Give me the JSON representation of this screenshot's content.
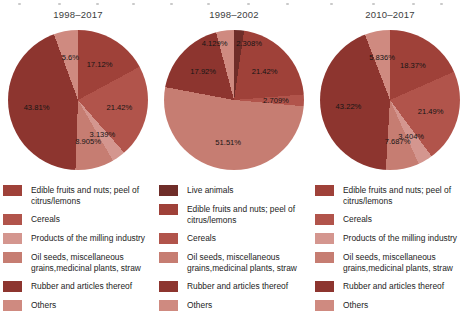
{
  "chart_data": [
    {
      "type": "pie",
      "title": "1998–2017",
      "labels": [
        "Edible fruits and nuts; peel of citrus/lemons",
        "Cereals",
        "Products of the milling industry",
        "Oil seeds, miscellaneous grains,medicinal plants, straw",
        "Rubber and articles thereof",
        "Others"
      ],
      "legend_lines": [
        [
          "Edible fruits and nuts; peel of",
          "citrus/lemons"
        ],
        [
          "Cereals"
        ],
        [
          "Products of the milling industry"
        ],
        [
          "Oil seeds, miscellaneous",
          "grains,medicinal plants, straw"
        ],
        [
          "Rubber and articles thereof"
        ],
        [
          "Others"
        ]
      ],
      "values": [
        17.12,
        21.42,
        3.139,
        8.905,
        43.81,
        5.6
      ],
      "display_labels": [
        "17.12%",
        "21.42%",
        "3.139%",
        "8.905%",
        "43.81%",
        "5.6%"
      ],
      "colors": [
        "#9f4139",
        "#b1544b",
        "#d4968f",
        "#c67d72",
        "#8d352f",
        "#cf8a80"
      ],
      "start_angle_deg": 0,
      "direction": "clockwise",
      "label_radius": [
        0.6,
        0.6,
        0.6,
        0.6,
        0.6,
        0.62
      ],
      "label_dx": [
        0,
        0,
        0,
        0,
        0,
        0
      ],
      "legend_position": "below"
    },
    {
      "type": "pie",
      "title": "1998–2002",
      "labels": [
        "Live animals",
        "Edible fruits and nuts; peel of citrus/lemons",
        "Cereals",
        "Oil seeds, miscellaneous grains,medicinal plants, straw",
        "Rubber and articles thereof",
        "Others"
      ],
      "legend_lines": [
        [
          "Live animals"
        ],
        [
          "Edible fruits and nuts; peel of",
          "citrus/lemons"
        ],
        [
          "Cereals"
        ],
        [
          "Oil seeds, miscellaneous",
          "grains,medicinal plants, straw"
        ],
        [
          "Rubber and articles thereof"
        ],
        [
          "Others"
        ]
      ],
      "values": [
        2.308,
        21.42,
        2.709,
        51.51,
        17.92,
        4.129
      ],
      "display_labels": [
        "2.308%",
        "21.42%",
        "2.709%",
        "51.51%",
        "17.92%",
        "4.129%"
      ],
      "colors": [
        "#6f2d29",
        "#9f4139",
        "#b1544b",
        "#c67d72",
        "#8d352f",
        "#cf8a80"
      ],
      "start_angle_deg": 0,
      "direction": "clockwise",
      "label_radius": [
        0.82,
        0.6,
        0.6,
        0.6,
        0.6,
        0.82
      ],
      "label_dx": [
        11,
        0,
        0,
        0,
        0,
        -12
      ],
      "legend_position": "below"
    },
    {
      "type": "pie",
      "title": "2010–2017",
      "labels": [
        "Edible fruits and nuts; peel of citrus/lemons",
        "Cereals",
        "Products of the milling industry",
        "Oil seeds, miscellaneous grains,medicinal plants, straw",
        "Rubber and articles thereof",
        "Others"
      ],
      "legend_lines": [
        [
          "Edible fruits and nuts; peel of",
          "citrus/lemons"
        ],
        [
          "Cereals"
        ],
        [
          "Products of the milling industry"
        ],
        [
          "Oil seeds, miscellaneous",
          "grains,medicinal plants, straw"
        ],
        [
          "Rubber and articles thereof"
        ],
        [
          "Others"
        ]
      ],
      "values": [
        18.37,
        21.49,
        3.404,
        7.687,
        43.22,
        5.836
      ],
      "display_labels": [
        "18.37%",
        "21.49%",
        "3.404%",
        "7.687%",
        "43.22%",
        "5.836%"
      ],
      "colors": [
        "#9f4139",
        "#b1544b",
        "#d4968f",
        "#c67d72",
        "#8d352f",
        "#cf8a80"
      ],
      "start_angle_deg": 0,
      "direction": "clockwise",
      "label_radius": [
        0.6,
        0.6,
        0.6,
        0.6,
        0.6,
        0.62
      ],
      "label_dx": [
        0,
        0,
        0,
        0,
        0,
        0
      ],
      "legend_position": "below"
    }
  ],
  "style": {
    "background": "#ffffff",
    "title_color": "#3d3d3d",
    "label_color": "#151515"
  }
}
